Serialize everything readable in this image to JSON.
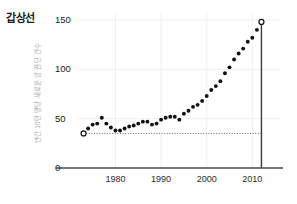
{
  "chart_data": {
    "type": "scatter",
    "title": "갑상선",
    "subtitle": "",
    "xlabel": "",
    "ylabel": "연간 10만 명당 새로운 암 진단 건수",
    "xlim": [
      1972,
      2013
    ],
    "ylim": [
      0,
      158
    ],
    "grid": true,
    "legend": null,
    "x_ticks": [
      1980,
      1990,
      2000,
      2010
    ],
    "x_tick_labels": [
      "1980",
      "1990",
      "2000",
      "2010"
    ],
    "y_ticks": [
      0,
      50,
      100,
      150
    ],
    "y_tick_labels": [
      "0",
      "50",
      "100",
      "150"
    ],
    "marker_color": "#111111",
    "annotation_line_color": "#444444",
    "reference_line": {
      "type": "horizontal-dotted",
      "value": 35,
      "from_x": 1973,
      "to_x": 2012
    },
    "vertical_marker": {
      "type": "vertical-solid",
      "x": 2012,
      "from_y": 0,
      "to_y": 148
    },
    "series": [
      {
        "name": "갑상선",
        "marker": "circle",
        "points": [
          {
            "x": 1973,
            "y": 35,
            "open": true
          },
          {
            "x": 1974,
            "y": 40
          },
          {
            "x": 1975,
            "y": 44
          },
          {
            "x": 1976,
            "y": 45
          },
          {
            "x": 1977,
            "y": 51
          },
          {
            "x": 1978,
            "y": 45
          },
          {
            "x": 1979,
            "y": 41
          },
          {
            "x": 1980,
            "y": 38
          },
          {
            "x": 1981,
            "y": 38
          },
          {
            "x": 1982,
            "y": 40
          },
          {
            "x": 1983,
            "y": 42
          },
          {
            "x": 1984,
            "y": 43
          },
          {
            "x": 1985,
            "y": 45
          },
          {
            "x": 1986,
            "y": 47
          },
          {
            "x": 1987,
            "y": 47
          },
          {
            "x": 1988,
            "y": 44
          },
          {
            "x": 1989,
            "y": 45
          },
          {
            "x": 1990,
            "y": 49
          },
          {
            "x": 1991,
            "y": 51
          },
          {
            "x": 1992,
            "y": 52
          },
          {
            "x": 1993,
            "y": 52
          },
          {
            "x": 1994,
            "y": 49
          },
          {
            "x": 1995,
            "y": 55
          },
          {
            "x": 1996,
            "y": 58
          },
          {
            "x": 1997,
            "y": 62
          },
          {
            "x": 1998,
            "y": 64
          },
          {
            "x": 1999,
            "y": 68
          },
          {
            "x": 2000,
            "y": 73
          },
          {
            "x": 2001,
            "y": 79
          },
          {
            "x": 2002,
            "y": 83
          },
          {
            "x": 2003,
            "y": 88
          },
          {
            "x": 2004,
            "y": 96
          },
          {
            "x": 2005,
            "y": 102
          },
          {
            "x": 2006,
            "y": 110
          },
          {
            "x": 2007,
            "y": 116
          },
          {
            "x": 2008,
            "y": 121
          },
          {
            "x": 2009,
            "y": 128
          },
          {
            "x": 2010,
            "y": 132
          },
          {
            "x": 2011,
            "y": 140
          },
          {
            "x": 2012,
            "y": 148,
            "open": true
          }
        ]
      }
    ]
  }
}
